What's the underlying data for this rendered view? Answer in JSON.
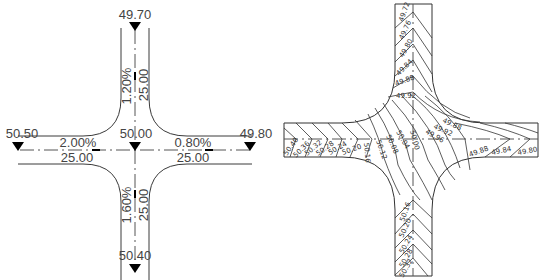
{
  "left_plan": {
    "title": "Intersection elevation plan",
    "elevations": {
      "north": "49.70",
      "west": "50.50",
      "center": "50.00",
      "east": "49.80",
      "south": "50.40"
    },
    "slopes": {
      "north": "1.20%",
      "west": "2.00%",
      "east": "0.80%",
      "south": "1.60%"
    },
    "widths": {
      "north": "25.00",
      "west": "25.00",
      "east": "25.00",
      "south": "25.00"
    }
  },
  "right_plan": {
    "title": "Contour grading plan",
    "north_contours": [
      "49.72",
      "49.76",
      "49.80",
      "49.84",
      "49.88",
      "49.92"
    ],
    "center_contours": [
      "49.96",
      "50.00",
      "50.04",
      "50.08",
      "50.12",
      "50.16"
    ],
    "west_contours": [
      "50.40",
      "50.36",
      "50.32",
      "50.28",
      "50.24",
      "50.20"
    ],
    "east_contours_upper": [
      "49.88",
      "49.92"
    ],
    "east_contours_lower": [
      "49.88",
      "49.84",
      "49.80"
    ],
    "south_contours": [
      "50.16",
      "50.20",
      "50.24",
      "50.28",
      "50.32"
    ]
  },
  "colors": {
    "line": "#3a3a3a",
    "marker": "#000000",
    "text": "#444444"
  }
}
